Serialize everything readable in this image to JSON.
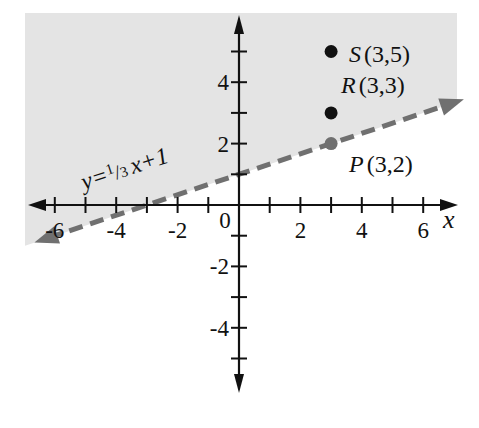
{
  "chart_data": {
    "type": "scatter",
    "title": "",
    "xlabel": "x",
    "ylabel": "",
    "xlim": [
      -7,
      7
    ],
    "ylim": [
      -6,
      6
    ],
    "grid": false,
    "x_ticks": [
      -6,
      -5,
      -4,
      -3,
      -2,
      -1,
      1,
      2,
      3,
      4,
      5,
      6
    ],
    "x_tick_labels": [
      {
        "value": -6,
        "label": "-6"
      },
      {
        "value": -4,
        "label": "-4"
      },
      {
        "value": -2,
        "label": "-2"
      },
      {
        "value": 0,
        "label": "0"
      },
      {
        "value": 2,
        "label": "2"
      },
      {
        "value": 4,
        "label": "4"
      },
      {
        "value": 6,
        "label": "6"
      }
    ],
    "y_ticks": [
      -5,
      -4,
      -3,
      -2,
      -1,
      1,
      2,
      3,
      4,
      5
    ],
    "y_tick_labels": [
      {
        "value": 4,
        "label": "4"
      },
      {
        "value": 2,
        "label": "2"
      },
      {
        "value": -2,
        "label": "-2"
      },
      {
        "value": -4,
        "label": "-4"
      }
    ],
    "boundary_line": {
      "equation_label": "y=1/3 x+1",
      "label_parts": {
        "lhs": "y=",
        "num": "1",
        "den": "3",
        "rhs": "x+1"
      },
      "slope": 0.3333,
      "intercept": 1,
      "style": "dashed",
      "color": "#707070",
      "x_range": [
        -6.6,
        7.0
      ]
    },
    "shaded_region": {
      "description": "y > 1/3 x + 1 (above dashed line)",
      "color": "#e4e4e4"
    },
    "points": [
      {
        "name": "S",
        "x": 3,
        "y": 5,
        "label": "(3,5)",
        "color": "#111111"
      },
      {
        "name": "R",
        "x": 3,
        "y": 3,
        "label": "(3,3)",
        "color": "#111111"
      },
      {
        "name": "P",
        "x": 3,
        "y": 2,
        "label": "(3,2)",
        "color": "#707070"
      }
    ]
  }
}
